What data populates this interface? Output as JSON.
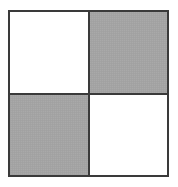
{
  "figure": {
    "canvas": {
      "width": 178,
      "height": 187,
      "background_color": "#ffffff"
    },
    "frame": {
      "left": 8,
      "top": 10,
      "width": 161,
      "height": 167,
      "border_color": "#3a3a3a",
      "border_width": 2
    },
    "dividers": {
      "vertical_x": 88,
      "horizontal_y": 93,
      "line_color": "#3a3a3a",
      "line_width": 2
    },
    "palette": {
      "white": "#ffffff",
      "gray": "#a9a9a9",
      "line": "#3a3a3a"
    },
    "quadrants": [
      {
        "id": "top-left",
        "row": 1,
        "col": 1,
        "fill": "white",
        "fill_color": "#ffffff",
        "label": ""
      },
      {
        "id": "top-right",
        "row": 1,
        "col": 2,
        "fill": "gray",
        "fill_color": "#a9a9a9",
        "label": ""
      },
      {
        "id": "bottom-left",
        "row": 2,
        "col": 1,
        "fill": "gray",
        "fill_color": "#a9a9a9",
        "label": ""
      },
      {
        "id": "bottom-right",
        "row": 2,
        "col": 2,
        "fill": "white",
        "fill_color": "#ffffff",
        "label": ""
      }
    ]
  }
}
